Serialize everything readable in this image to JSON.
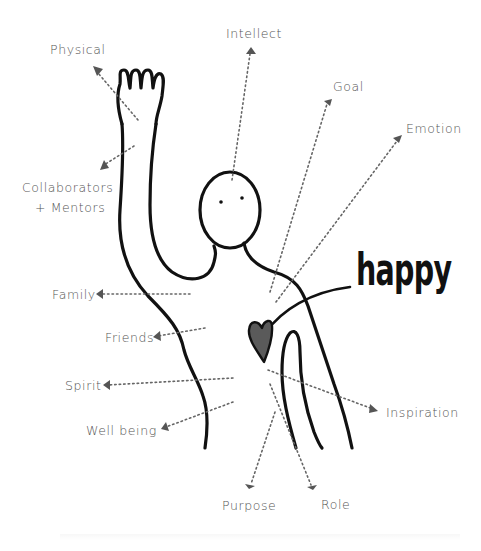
{
  "title_word": "happy",
  "colors": {
    "ink": "#111111",
    "label": "#555555",
    "dotted": "#666666",
    "heart": "#5a5a5a"
  },
  "labels": [
    {
      "id": "physical",
      "text": "Physical",
      "lines": [
        "Physical"
      ]
    },
    {
      "id": "collaborators",
      "text": "Collaborators + Mentors",
      "lines": [
        "Collaborators",
        "+ Mentors"
      ]
    },
    {
      "id": "intellect",
      "text": "Intellect",
      "lines": [
        "Intellect"
      ]
    },
    {
      "id": "goal",
      "text": "Goal",
      "lines": [
        "Goal"
      ]
    },
    {
      "id": "emotion",
      "text": "Emotion",
      "lines": [
        "Emotion"
      ]
    },
    {
      "id": "family",
      "text": "Family",
      "lines": [
        "Family"
      ]
    },
    {
      "id": "friends",
      "text": "Friends",
      "lines": [
        "Friends"
      ]
    },
    {
      "id": "spirit",
      "text": "Spirit",
      "lines": [
        "Spirit"
      ]
    },
    {
      "id": "wellbeing",
      "text": "Well being",
      "lines": [
        "Well being"
      ]
    },
    {
      "id": "inspiration",
      "text": "Inspiration",
      "lines": [
        "Inspiration"
      ]
    },
    {
      "id": "purpose",
      "text": "Purpose",
      "lines": [
        "Purpose"
      ]
    },
    {
      "id": "role",
      "text": "Role",
      "lines": [
        "Role"
      ]
    }
  ],
  "figure": {
    "icons": [
      "person-figure",
      "raised-hand",
      "heart-icon",
      "arrow-icon"
    ]
  }
}
